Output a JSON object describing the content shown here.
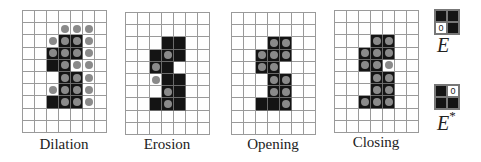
{
  "grid": {
    "cols": 7,
    "rows": 10
  },
  "panels": [
    {
      "label": "Dilation",
      "x": 22,
      "y": 10,
      "black": [
        [
          2,
          3
        ],
        [
          2,
          4
        ],
        [
          3,
          2
        ],
        [
          3,
          3
        ],
        [
          3,
          4
        ],
        [
          4,
          2
        ],
        [
          4,
          3
        ],
        [
          5,
          3
        ],
        [
          5,
          4
        ],
        [
          6,
          3
        ],
        [
          6,
          4
        ],
        [
          7,
          2
        ],
        [
          7,
          3
        ],
        [
          7,
          4
        ]
      ],
      "dots": [
        [
          1,
          3
        ],
        [
          1,
          4
        ],
        [
          1,
          5
        ],
        [
          2,
          2
        ],
        [
          2,
          3
        ],
        [
          2,
          4
        ],
        [
          2,
          5
        ],
        [
          3,
          2
        ],
        [
          3,
          3
        ],
        [
          3,
          4
        ],
        [
          3,
          5
        ],
        [
          4,
          3
        ],
        [
          4,
          4
        ],
        [
          4,
          5
        ],
        [
          5,
          3
        ],
        [
          5,
          4
        ],
        [
          5,
          5
        ],
        [
          6,
          2
        ],
        [
          6,
          3
        ],
        [
          6,
          4
        ],
        [
          6,
          5
        ],
        [
          7,
          3
        ],
        [
          7,
          4
        ],
        [
          7,
          5
        ]
      ]
    },
    {
      "label": "Erosion",
      "x": 125,
      "y": 12,
      "black": [
        [
          2,
          3
        ],
        [
          2,
          4
        ],
        [
          3,
          2
        ],
        [
          3,
          3
        ],
        [
          3,
          4
        ],
        [
          4,
          2
        ],
        [
          4,
          3
        ],
        [
          5,
          3
        ],
        [
          5,
          4
        ],
        [
          6,
          3
        ],
        [
          6,
          4
        ],
        [
          7,
          2
        ],
        [
          7,
          3
        ],
        [
          7,
          4
        ]
      ],
      "dots": [
        [
          3,
          3
        ],
        [
          4,
          2
        ],
        [
          5,
          2
        ],
        [
          6,
          3
        ],
        [
          7,
          3
        ]
      ]
    },
    {
      "label": "Opening",
      "x": 231,
      "y": 12,
      "black": [
        [
          2,
          3
        ],
        [
          2,
          4
        ],
        [
          3,
          2
        ],
        [
          3,
          3
        ],
        [
          3,
          4
        ],
        [
          4,
          2
        ],
        [
          4,
          3
        ],
        [
          5,
          3
        ],
        [
          5,
          4
        ],
        [
          6,
          3
        ],
        [
          6,
          4
        ],
        [
          7,
          2
        ],
        [
          7,
          3
        ],
        [
          7,
          4
        ]
      ],
      "dots": [
        [
          2,
          3
        ],
        [
          2,
          4
        ],
        [
          3,
          2
        ],
        [
          3,
          3
        ],
        [
          3,
          4
        ],
        [
          4,
          2
        ],
        [
          4,
          3
        ],
        [
          5,
          3
        ],
        [
          5,
          4
        ],
        [
          6,
          3
        ],
        [
          6,
          4
        ],
        [
          7,
          4
        ]
      ]
    },
    {
      "label": "Closing",
      "x": 334,
      "y": 10,
      "black": [
        [
          2,
          3
        ],
        [
          2,
          4
        ],
        [
          3,
          2
        ],
        [
          3,
          3
        ],
        [
          3,
          4
        ],
        [
          4,
          2
        ],
        [
          4,
          3
        ],
        [
          5,
          3
        ],
        [
          5,
          4
        ],
        [
          6,
          3
        ],
        [
          6,
          4
        ],
        [
          7,
          2
        ],
        [
          7,
          3
        ],
        [
          7,
          4
        ]
      ],
      "dots": [
        [
          2,
          3
        ],
        [
          2,
          4
        ],
        [
          3,
          2
        ],
        [
          3,
          3
        ],
        [
          3,
          4
        ],
        [
          4,
          2
        ],
        [
          4,
          3
        ],
        [
          4,
          4
        ],
        [
          5,
          3
        ],
        [
          5,
          4
        ],
        [
          6,
          3
        ],
        [
          6,
          4
        ],
        [
          7,
          2
        ],
        [
          7,
          3
        ],
        [
          7,
          4
        ]
      ]
    }
  ],
  "kernels": [
    {
      "name": "E",
      "sup": "",
      "x": 434,
      "y": 9,
      "cells": [
        "black",
        "black",
        "origin",
        "black"
      ],
      "origin_text": "0"
    },
    {
      "name": "E",
      "sup": "*",
      "x": 434,
      "y": 84,
      "cells": [
        "black",
        "origin",
        "black",
        "black"
      ],
      "origin_text": "0"
    }
  ],
  "labels": {
    "dilation": "Dilation",
    "erosion": "Erosion",
    "opening": "Opening",
    "closing": "Closing",
    "kernel_e": "E",
    "kernel_e_star": "E",
    "kernel_e_star_sup": "*"
  },
  "colors": {
    "black_pixel": "#141414",
    "dot": "#8a8a8a",
    "grid_line": "#9a9a9a"
  }
}
